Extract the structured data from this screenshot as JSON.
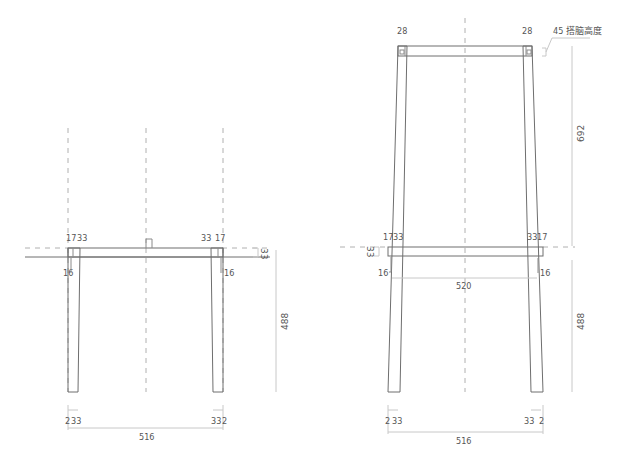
{
  "front_view": {
    "seat_labels": {
      "left_outer": "17",
      "left_inner": "33",
      "right_inner": "33",
      "right_outer": "17",
      "left_taper": "16",
      "right_taper": "16",
      "seat_thickness": "33"
    },
    "height_dim": "488",
    "bottom_labels": {
      "left_gap": "2",
      "left_leg": "33",
      "right_leg": "33",
      "right_gap": "2",
      "overall_width": "516"
    }
  },
  "side_view": {
    "top_labels": {
      "left_post": "28",
      "right_post": "28",
      "rail_note": "45 搭脑高度"
    },
    "back_height_dim": "692",
    "seat_labels": {
      "left_outer": "17",
      "left_inner": "33",
      "right_inner": "33",
      "right_outer": "17",
      "left_taper": "16",
      "right_taper": "16",
      "seat_thickness": "33",
      "seat_depth": "520"
    },
    "height_dim": "488",
    "bottom_labels": {
      "left_gap": "2",
      "left_leg": "33",
      "right_leg": "33",
      "right_gap": "2",
      "overall_width": "516"
    }
  },
  "colors": {
    "line": "#8a8a8a",
    "dimension": "#c8c8c8",
    "centerline": "#b0b0b0",
    "text": "#555555"
  }
}
